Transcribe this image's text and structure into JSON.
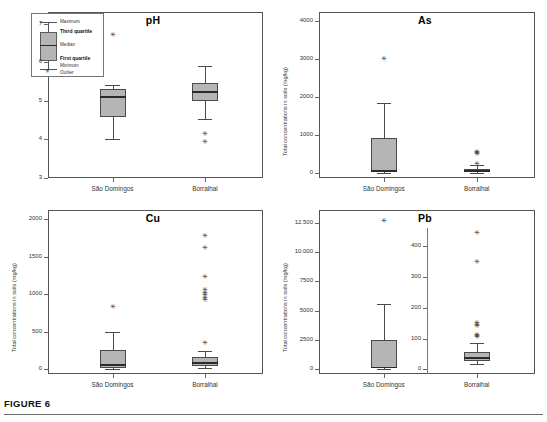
{
  "figure": {
    "caption": "FIGURE 6",
    "categories": [
      "São Domingos",
      "Borralhal"
    ],
    "ylabel": "Total concentrations in soils (mg/kg)"
  },
  "legend": {
    "items": [
      {
        "key": "maximum",
        "label": "Maximum"
      },
      {
        "key": "third_quartile",
        "label": "Third quartile"
      },
      {
        "key": "median",
        "label": "Median"
      },
      {
        "key": "first_quartile",
        "label": "First quartile"
      },
      {
        "key": "minimum",
        "label": "Minimum"
      },
      {
        "key": "outlier",
        "label": "Outlier"
      }
    ]
  },
  "chart_data": [
    {
      "type": "box",
      "title": "pH",
      "xlabel": "",
      "ylabel": "",
      "ylim": [
        3,
        7.3
      ],
      "yticks": [
        3,
        4,
        5,
        6,
        7
      ],
      "ytick_labels": [
        "3",
        "4",
        "5",
        "6",
        "7"
      ],
      "categories": [
        "São Domingos",
        "Borralhal"
      ],
      "grid": false,
      "boxes": [
        {
          "category": "São Domingos",
          "min": 4.02,
          "q1": 4.57,
          "median": 5.1,
          "q3": 5.3,
          "max": 5.42,
          "outliers": [
            6.7
          ]
        },
        {
          "category": "Borralhal",
          "min": 4.52,
          "q1": 5.0,
          "median": 5.22,
          "q3": 5.45,
          "max": 5.9,
          "outliers": [
            4.13,
            3.93
          ]
        }
      ]
    },
    {
      "type": "box",
      "title": "As",
      "xlabel": "",
      "ylabel": "Total concentrations in soils (mg/kg)",
      "ylim": [
        -120,
        4250
      ],
      "yticks": [
        0,
        1000,
        2000,
        3000,
        4000
      ],
      "ytick_labels": [
        "0",
        "1000",
        "2000",
        "3000",
        "4000"
      ],
      "categories": [
        "São Domingos",
        "Borralhal"
      ],
      "grid": false,
      "boxes": [
        {
          "category": "São Domingos",
          "min": 10,
          "q1": 30,
          "median": 60,
          "q3": 920,
          "max": 1850,
          "outliers": [
            3010
          ]
        },
        {
          "category": "Borralhal",
          "min": 15,
          "q1": 40,
          "median": 70,
          "q3": 110,
          "max": 230,
          "outliers": [
            560,
            540,
            520,
            250
          ]
        }
      ]
    },
    {
      "type": "box",
      "title": "Cu",
      "xlabel": "",
      "ylabel": "Total concentrations in soils (mg/kg)",
      "ylim": [
        -60,
        2120
      ],
      "yticks": [
        0,
        500,
        1000,
        1500,
        2000
      ],
      "ytick_labels": [
        "0",
        "500",
        "1000",
        "1500",
        "2000"
      ],
      "categories": [
        "São Domingos",
        "Borralhal"
      ],
      "grid": false,
      "boxes": [
        {
          "category": "São Domingos",
          "min": 10,
          "q1": 25,
          "median": 60,
          "q3": 265,
          "max": 500,
          "outliers": [
            830
          ]
        },
        {
          "category": "Borralhal",
          "min": 20,
          "q1": 50,
          "median": 85,
          "q3": 160,
          "max": 240,
          "outliers": [
            1780,
            1615,
            1230,
            1060,
            1020,
            990,
            950,
            920,
            355
          ]
        }
      ]
    },
    {
      "type": "box",
      "title": "Pb",
      "xlabel": "",
      "ylabel": "Total concentrations in soils (mg/kg)",
      "split_axis": true,
      "ylim": [
        -400,
        13600
      ],
      "yticks": [
        0,
        2500,
        5000,
        7500,
        10000,
        12500
      ],
      "ytick_labels": [
        "0",
        "2500",
        "5000",
        "7500",
        "10.000",
        "12.500"
      ],
      "inner_ylim": [
        -15,
        460
      ],
      "inner_yticks": [
        0,
        100,
        200,
        300,
        400
      ],
      "inner_ytick_labels": [
        "0",
        "100",
        "200",
        "300",
        "400"
      ],
      "categories": [
        "São Domingos",
        "Borralhal"
      ],
      "grid": false,
      "boxes": [
        {
          "category": "São Domingos",
          "min": 30,
          "q1": 90,
          "median": 150,
          "q3": 2480,
          "max": 5600,
          "outliers": [
            12700
          ]
        },
        {
          "category": "Borralhal",
          "min": 18,
          "q1": 28,
          "median": 38,
          "q3": 58,
          "max": 85,
          "outliers": [
            445,
            348,
            152,
            143,
            140,
            113,
            108,
            105
          ]
        }
      ]
    }
  ]
}
